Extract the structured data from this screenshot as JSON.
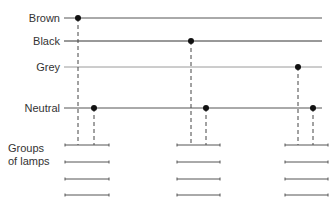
{
  "diagram": {
    "wires": [
      {
        "id": "brown",
        "label": "Brown",
        "color": "#555555"
      },
      {
        "id": "black",
        "label": "Black",
        "color": "#333333"
      },
      {
        "id": "grey",
        "label": "Grey",
        "color": "#9a9a9a"
      },
      {
        "id": "neutral",
        "label": "Neutral",
        "color": "#555555"
      }
    ],
    "groups_label_line1": "Groups",
    "groups_label_line2": "of lamps",
    "lamp_groups": [
      {
        "phase": "brown",
        "lamp_count": 4
      },
      {
        "phase": "black",
        "lamp_count": 4
      },
      {
        "phase": "grey",
        "lamp_count": 4
      }
    ],
    "dot_color": "#111111",
    "dash_color": "#444444"
  }
}
